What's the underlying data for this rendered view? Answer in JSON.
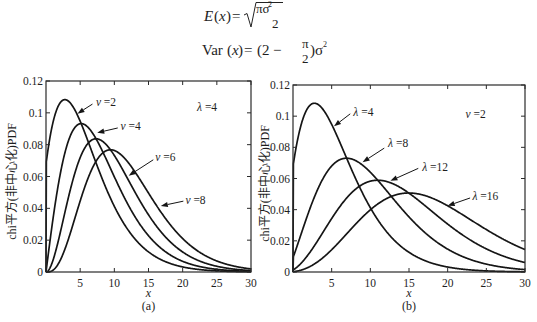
{
  "formulas": {
    "mean": {
      "E": "E",
      "lp": "(",
      "x": "x",
      "rp": ")",
      "eq": "=",
      "num": "πσ",
      "num_sup": "2",
      "den": "2"
    },
    "variance": {
      "var": "Var",
      "lp": "(",
      "x": "x",
      "rp": ")",
      "eq": "=",
      "lp2": "(2",
      "minus": "−",
      "num": "π",
      "den": "2",
      "rp2": ")σ",
      "sup": "2"
    }
  },
  "chart_data": [
    {
      "id": "a",
      "type": "line",
      "caption": "(a)",
      "xlabel": "x",
      "ylabel": "chi平方(非中心化)PDF",
      "xlim": [
        0,
        30
      ],
      "ylim": [
        0,
        0.12
      ],
      "grid": false,
      "legend": "none (inline arrow labels)",
      "xticks": [
        5,
        10,
        15,
        20,
        25,
        30
      ],
      "xticklabels": [
        "5",
        "10",
        "15",
        "20",
        "25",
        "30"
      ],
      "yticks": [
        0,
        0.02,
        0.04,
        0.06,
        0.08,
        0.1,
        0.12
      ],
      "yticklabels": [
        "0",
        "0.02",
        "0.04",
        "0.06",
        "0.08",
        "0.1",
        "0.12"
      ],
      "note": {
        "text": "λ =4",
        "pos": [
          22.1,
          0.101
        ]
      },
      "x": [
        0,
        5,
        10,
        15,
        20,
        25,
        30
      ],
      "series": [
        {
          "name": "v =2",
          "df": 2,
          "lambda": 4,
          "peak": [
            3.0,
            0.108
          ],
          "values": [
            0,
            0.095,
            0.041,
            0.013,
            0.003,
            0.0007,
            0.0001
          ],
          "label_pos": [
            7.3,
            0.104
          ],
          "arrow_from": [
            6.8,
            0.1055
          ],
          "arrow_to": [
            4.6,
            0.0995
          ]
        },
        {
          "name": "v =4",
          "df": 4,
          "lambda": 4,
          "peak": [
            5.0,
            0.093
          ],
          "values": [
            0,
            0.093,
            0.06,
            0.023,
            0.0067,
            0.0017,
            0.0004
          ],
          "label_pos": [
            10.9,
            0.089
          ],
          "arrow_from": [
            10.5,
            0.0905
          ],
          "arrow_to": [
            7.5,
            0.0875
          ]
        },
        {
          "name": "v =6",
          "df": 6,
          "lambda": 4,
          "peak": [
            7.2,
            0.084
          ],
          "values": [
            0,
            0.072,
            0.073,
            0.036,
            0.0126,
            0.0036,
            0.0009
          ],
          "label_pos": [
            16.0,
            0.07
          ],
          "arrow_from": [
            15.7,
            0.0705
          ],
          "arrow_to": [
            12.1,
            0.0605
          ]
        },
        {
          "name": "v =8",
          "df": 8,
          "lambda": 4,
          "peak": [
            9.3,
            0.077
          ],
          "values": [
            0,
            0.045,
            0.076,
            0.05,
            0.021,
            0.007,
            0.002
          ],
          "label_pos": [
            20.4,
            0.043
          ],
          "arrow_from": [
            20.1,
            0.0445
          ],
          "arrow_to": [
            16.8,
            0.0415
          ]
        }
      ]
    },
    {
      "id": "b",
      "type": "line",
      "caption": "(b)",
      "xlabel": "x",
      "ylabel": "chi平方(非中心化)PDF",
      "xlim": [
        0,
        30
      ],
      "ylim": [
        0,
        0.12
      ],
      "grid": false,
      "legend": "none (inline arrow labels)",
      "xticks": [
        5,
        10,
        15,
        20,
        25,
        30
      ],
      "xticklabels": [
        "5",
        "10",
        "15",
        "20",
        "25",
        "30"
      ],
      "yticks": [
        0,
        0.02,
        0.04,
        0.06,
        0.08,
        0.1,
        0.12
      ],
      "yticklabels": [
        "0",
        "0.02",
        "0.04",
        "0.06",
        "0.08",
        "0.1",
        "0.12"
      ],
      "note": {
        "text": "v =2",
        "pos": [
          22.3,
          0.099
        ]
      },
      "x": [
        0,
        5,
        10,
        15,
        20,
        25,
        30
      ],
      "series": [
        {
          "name": "λ =4",
          "df": 2,
          "lambda": 4,
          "peak": [
            3.0,
            0.108
          ],
          "values": [
            0,
            0.095,
            0.041,
            0.013,
            0.003,
            0.0007,
            0.0001
          ],
          "label_pos": [
            7.8,
            0.1
          ],
          "arrow_from": [
            7.4,
            0.1015
          ],
          "arrow_to": [
            5.3,
            0.0935
          ]
        },
        {
          "name": "λ =8",
          "df": 2,
          "lambda": 8,
          "peak": [
            6.5,
            0.073
          ],
          "values": [
            0,
            0.068,
            0.064,
            0.035,
            0.015,
            0.005,
            0.0015
          ],
          "label_pos": [
            12.3,
            0.08
          ],
          "arrow_from": [
            11.8,
            0.0795
          ],
          "arrow_to": [
            9.0,
            0.0705
          ]
        },
        {
          "name": "λ =12",
          "df": 2,
          "lambda": 12,
          "peak": [
            11.0,
            0.06
          ],
          "values": [
            0,
            0.034,
            0.059,
            0.051,
            0.031,
            0.015,
            0.006
          ],
          "label_pos": [
            16.7,
            0.065
          ],
          "arrow_from": [
            16.2,
            0.0665
          ],
          "arrow_to": [
            12.6,
            0.0585
          ]
        },
        {
          "name": "λ =16",
          "df": 2,
          "lambda": 16,
          "peak": [
            15.0,
            0.051
          ],
          "values": [
            0,
            0.014,
            0.04,
            0.051,
            0.043,
            0.027,
            0.014
          ],
          "label_pos": [
            23.2,
            0.046
          ],
          "arrow_from": [
            22.9,
            0.0475
          ],
          "arrow_to": [
            20.0,
            0.0425
          ]
        }
      ]
    }
  ]
}
